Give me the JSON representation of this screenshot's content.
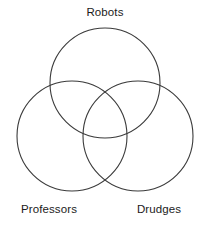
{
  "figure": {
    "name": "three-set-venn-diagram",
    "background_color": "#ffffff",
    "stroke_color": "#3a3a3a",
    "text_color": "#1b1b1b"
  },
  "chart_data": {
    "type": "diagram",
    "diagram_type": "venn",
    "title": "",
    "set_count": 3,
    "filled": false,
    "legend": "none",
    "sets": [
      {
        "label": "Robots",
        "position": "top",
        "cx": 105,
        "cy": 83,
        "r": 55,
        "label_x": 105,
        "label_y": 16,
        "label_anchor": "middle"
      },
      {
        "label": "Professors",
        "position": "bottom-left",
        "cx": 72,
        "cy": 136,
        "r": 55,
        "label_x": 49,
        "label_y": 213,
        "label_anchor": "middle"
      },
      {
        "label": "Drudges",
        "position": "bottom-right",
        "cx": 138,
        "cy": 136,
        "r": 55,
        "label_x": 159,
        "label_y": 213,
        "label_anchor": "middle"
      }
    ],
    "regions": [],
    "region_values": []
  }
}
